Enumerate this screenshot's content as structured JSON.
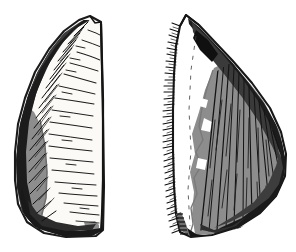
{
  "figure": {
    "kind": "line-art-illustration",
    "alt_text": "Black and white archaeological drawing of a flaked stone tool shown in two views, obverse on the left and reverse on the right",
    "canvas": {
      "width": 296,
      "height": 252
    },
    "background_color": "#ffffff",
    "palette": {
      "ink": "#141414",
      "outline": "#1a1a1a",
      "cortex_gray": "#8d8d8d",
      "gray_shadow": "#6f6f6f",
      "flake_white": "#ffffff",
      "off_white": "#f4f2ee",
      "dark_retouch": "#2a2a2a"
    },
    "objects": [
      {
        "id": "left-view",
        "label": "obverse-view",
        "description": "Elongated triangular flake, apex at top, broad rounded base at bottom. Right margin nearly straight and vertical; left margin heavily retouched with dark steep flaking. Interior flake surface pale with fine horizontal ripple scars radiating from the left edge. Lower left carries a gray cortex patch.",
        "bbox": {
          "x": 14,
          "y": 14,
          "width": 110,
          "height": 224
        },
        "body_fill": "#fbfaf7",
        "cortex_fill": "#8d8d8d",
        "retouch_fill": "#2a2a2a",
        "ripple_count": 18
      },
      {
        "id": "right-view",
        "label": "reverse-view",
        "description": "Mirror view of the same flake. Left margin is finely denticulated with dense short retouch ticks. A narrow white band runs down the left side; the remainder of the dorsal face is gray with long diagonal flake ridges converging toward the upper apex. Base terminates in a dark stepped bulb.",
        "bbox": {
          "x": 167,
          "y": 14,
          "width": 125,
          "height": 224
        },
        "body_fill": "#8d8d8d",
        "band_fill": "#ffffff",
        "retouch_fill": "#171717",
        "denticulation_ticks": 46,
        "hatch_line_count": 24
      }
    ]
  }
}
